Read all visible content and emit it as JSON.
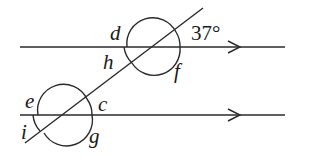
{
  "diagram": {
    "type": "parallel-lines-transversal",
    "parallel_lines": [
      {
        "id": "top-line",
        "y": 47,
        "x1": 20,
        "x2": 285,
        "arrow_x": 240
      },
      {
        "id": "bottom-line",
        "y": 115,
        "x1": 20,
        "x2": 285,
        "arrow_x": 240
      }
    ],
    "transversal": {
      "x1": 25,
      "y1": 143,
      "x2": 203,
      "y2": 8
    },
    "intersections": [
      {
        "id": "top",
        "cx": 152,
        "cy": 47,
        "r": 28
      },
      {
        "id": "bottom",
        "cx": 63,
        "cy": 115,
        "r": 27
      }
    ],
    "labels": {
      "d": "d",
      "h": "h",
      "f": "f",
      "given_angle": "37°",
      "e": "e",
      "c": "c",
      "i": "i",
      "g": "g"
    },
    "colors": {
      "stroke": "#2a2a2a",
      "text": "#1a1a1a",
      "background": "#ffffff"
    }
  }
}
